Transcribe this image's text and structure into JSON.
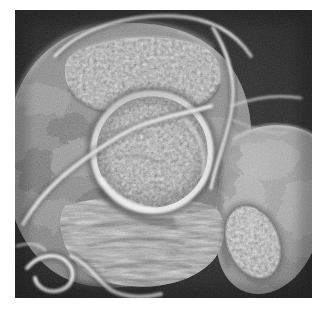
{
  "page": {
    "background_color": "#ffffff",
    "width": 325,
    "height": 317
  },
  "figure": {
    "name": "grayscale-micrograph",
    "kind": "scientific-micrograph",
    "modality": "scanning-electron-micrograph",
    "color_mode": "grayscale",
    "caption": "",
    "label": "",
    "scale_bar": "",
    "plate": {
      "left": 15,
      "top": 10,
      "width": 297,
      "height": 288,
      "background_color": "#2b2b2b",
      "border": "none"
    },
    "tones": {
      "background_dark": "#2a2a2a",
      "background_darker": "#1e1e1e",
      "mass_midtone": "#8c8c8c",
      "mass_shadow": "#4a4a4a",
      "highlight": "#e8e8e8",
      "bright_rim": "#d8d8d8",
      "granule_light": "#cfcfcf",
      "granule_dark": "#5a5a5a"
    },
    "structures": [
      {
        "id": "main-mass",
        "label": "central rounded body",
        "shape": "irregular-oval",
        "cx": 140,
        "cy": 150,
        "rx": 140,
        "ry": 140,
        "tone": "#8c8c8c"
      },
      {
        "id": "central-disc",
        "label": "central circular granular disc",
        "shape": "circle",
        "cx": 152,
        "cy": 152,
        "r": 56,
        "tone": "#9a9a9a",
        "rim_tone": "#dcdcdc"
      },
      {
        "id": "upper-granular-patch",
        "label": "upper granular patch",
        "shape": "oval",
        "cx": 140,
        "cy": 70,
        "rx": 75,
        "ry": 40,
        "tone": "#a8a8a8"
      },
      {
        "id": "lower-right-granular-oval",
        "label": "lower-right granular oval body",
        "shape": "oval",
        "cx": 253,
        "cy": 240,
        "rx": 28,
        "ry": 38,
        "rotation": -25,
        "tone": "#bcbcbc"
      },
      {
        "id": "right-lobe",
        "label": "right smooth lobe",
        "shape": "oval",
        "cx": 272,
        "cy": 190,
        "rx": 55,
        "ry": 70,
        "tone": "#a0a0a0"
      },
      {
        "id": "lower-fibrous-zone",
        "label": "lower fibrous striated zone",
        "shape": "band",
        "cx": 150,
        "cy": 235,
        "tone": "#8a8a8a"
      }
    ],
    "filaments": [
      {
        "id": "upper-arc-filament",
        "label": "bright arc filament across upper rim",
        "tone": "#dcdcdc",
        "width": 4
      },
      {
        "id": "upper-right-branching-filament",
        "label": "branching filament upper right",
        "tone": "#d4d4d4",
        "width": 4
      },
      {
        "id": "central-sweep-filament",
        "label": "filament sweeping around central disc",
        "tone": "#dadada",
        "width": 5
      },
      {
        "id": "lower-left-hook-filament",
        "label": "hooked filament at lower left",
        "tone": "#e0e0e0",
        "width": 5
      },
      {
        "id": "lower-left-curl-filament",
        "label": "small curled filament at lower left",
        "tone": "#d0d0d0",
        "width": 4
      }
    ]
  }
}
